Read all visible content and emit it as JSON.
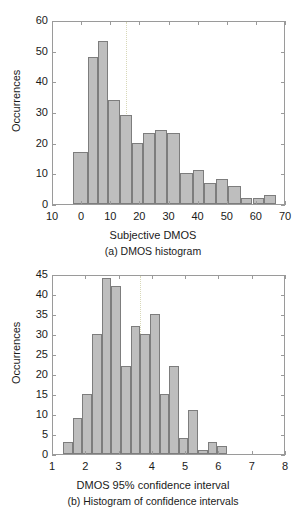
{
  "figure": {
    "background": "#ffffff",
    "bar_fill": "#bebebe",
    "bar_stroke": "#7d7d7d",
    "axis_color": "#9a9a9a",
    "text_color": "#1a1a1a"
  },
  "panel_a": {
    "caption": "(a) DMOS histogram",
    "axis_title_x": "Subjective DMOS",
    "axis_title_y": "Occurrences"
  },
  "panel_b": {
    "caption": "(b) Histogram of confidence intervals",
    "axis_title_x": "DMOS 95% confidence interval",
    "axis_title_y": "Occurrences"
  },
  "chart_data": [
    {
      "type": "bar",
      "id": "dmos-histogram",
      "title": "(a) DMOS histogram",
      "xlabel": "Subjective DMOS",
      "ylabel": "Occurrences",
      "xlim": [
        10,
        70
      ],
      "ylim": [
        0,
        60
      ],
      "xticks": [
        10,
        0,
        10,
        20,
        30,
        40,
        50,
        60,
        70
      ],
      "xtick_labels": [
        "10",
        "0",
        "10",
        "20",
        "30",
        "40",
        "50",
        "60",
        "70"
      ],
      "yticks": [
        0,
        10,
        20,
        30,
        40,
        50,
        60
      ],
      "ytick_labels": [
        "0",
        "10",
        "20",
        "30",
        "40",
        "50",
        "60"
      ],
      "grid": false,
      "note": "x axis leftmost tick is drawn as '10' but represents -10; bin width 5 starting at -3",
      "reference_line_x": 15,
      "bin_width": 5,
      "bin_starts": [
        -3,
        2,
        7,
        12,
        17,
        22,
        27,
        32,
        37,
        42,
        47,
        52,
        57,
        62
      ],
      "bin_centers": [
        -0.5,
        4.5,
        9.5,
        14.5,
        19.5,
        24.5,
        29.5,
        34.5,
        39.5,
        44.5,
        49.5,
        54.5,
        59.5,
        64.5
      ],
      "values": [
        17,
        48,
        53,
        34,
        29,
        20,
        23,
        24,
        23,
        10,
        11,
        7,
        8,
        6,
        2,
        2,
        3
      ],
      "bars": [
        {
          "start": -3,
          "end": 2,
          "value": 17
        },
        {
          "start": 2,
          "end": 5.5,
          "value": 48
        },
        {
          "start": 5.5,
          "end": 9,
          "value": 53
        },
        {
          "start": 9,
          "end": 13,
          "value": 34
        },
        {
          "start": 13,
          "end": 17,
          "value": 29
        },
        {
          "start": 17,
          "end": 21,
          "value": 20
        },
        {
          "start": 21,
          "end": 25,
          "value": 23
        },
        {
          "start": 25,
          "end": 29,
          "value": 24
        },
        {
          "start": 29,
          "end": 33.5,
          "value": 23
        },
        {
          "start": 33.5,
          "end": 38,
          "value": 10
        },
        {
          "start": 38,
          "end": 42,
          "value": 11
        },
        {
          "start": 42,
          "end": 46,
          "value": 7
        },
        {
          "start": 46,
          "end": 50,
          "value": 8
        },
        {
          "start": 50,
          "end": 54.5,
          "value": 6
        },
        {
          "start": 54.5,
          "end": 58.5,
          "value": 2
        },
        {
          "start": 58.5,
          "end": 62.5,
          "value": 2
        },
        {
          "start": 62.5,
          "end": 66.5,
          "value": 3
        }
      ]
    },
    {
      "type": "bar",
      "id": "confidence-interval-histogram",
      "title": "(b) Histogram of confidence intervals",
      "xlabel": "DMOS 95% confidence interval",
      "ylabel": "Occurrences",
      "xlim": [
        1,
        8
      ],
      "ylim": [
        0,
        45
      ],
      "xticks": [
        1,
        2,
        3,
        4,
        5,
        6,
        7,
        8
      ],
      "xtick_labels": [
        "1",
        "2",
        "3",
        "4",
        "5",
        "6",
        "7",
        "8"
      ],
      "yticks": [
        0,
        5,
        10,
        15,
        20,
        25,
        30,
        35,
        40,
        45
      ],
      "ytick_labels": [
        "0",
        "5",
        "10",
        "15",
        "20",
        "25",
        "30",
        "35",
        "40",
        "45"
      ],
      "grid": false,
      "reference_line_x": 3.6,
      "bin_width": 0.29,
      "bars": [
        {
          "start": 1.3,
          "end": 1.59,
          "value": 3
        },
        {
          "start": 1.59,
          "end": 1.88,
          "value": 9
        },
        {
          "start": 1.88,
          "end": 2.17,
          "value": 15
        },
        {
          "start": 2.17,
          "end": 2.46,
          "value": 30
        },
        {
          "start": 2.46,
          "end": 2.75,
          "value": 44
        },
        {
          "start": 2.75,
          "end": 3.04,
          "value": 42
        },
        {
          "start": 3.04,
          "end": 3.33,
          "value": 22
        },
        {
          "start": 3.33,
          "end": 3.62,
          "value": 32
        },
        {
          "start": 3.62,
          "end": 3.91,
          "value": 30
        },
        {
          "start": 3.91,
          "end": 4.2,
          "value": 35
        },
        {
          "start": 4.2,
          "end": 4.49,
          "value": 15
        },
        {
          "start": 4.49,
          "end": 4.78,
          "value": 22
        },
        {
          "start": 4.78,
          "end": 5.07,
          "value": 4
        },
        {
          "start": 5.07,
          "end": 5.36,
          "value": 11
        },
        {
          "start": 5.36,
          "end": 5.65,
          "value": 1
        },
        {
          "start": 5.65,
          "end": 5.94,
          "value": 3
        },
        {
          "start": 5.94,
          "end": 6.23,
          "value": 2
        }
      ]
    }
  ]
}
